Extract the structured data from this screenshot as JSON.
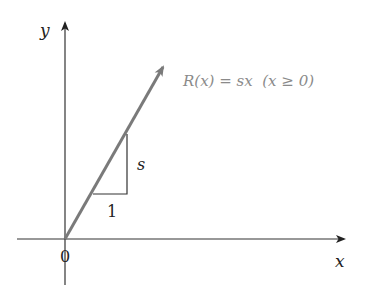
{
  "diagram": {
    "axes": {
      "x_label": "x",
      "y_label": "y",
      "origin_label": "0"
    },
    "ray": {
      "description": "ray through origin with slope s",
      "color": "#7a7a7a"
    },
    "slope_triangle": {
      "run_label": "1",
      "rise_label": "s"
    },
    "formula": {
      "text": "R(x) = sx  (x ≥ 0)",
      "color": "#8a8a8a"
    },
    "colors": {
      "axis": "#333333",
      "text": "#222222"
    }
  }
}
